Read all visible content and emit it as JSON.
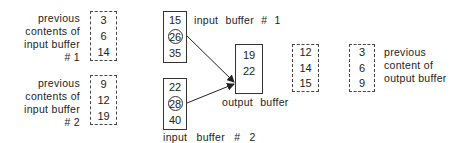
{
  "prev_input_1": {
    "label_lines": [
      "previous",
      "contents of",
      "input buffer",
      "# 1"
    ],
    "values": [
      "3",
      "6",
      "14"
    ]
  },
  "prev_input_2": {
    "label_lines": [
      "previous",
      "contents of",
      "input buffer",
      "# 2"
    ],
    "values": [
      "9",
      "12",
      "19"
    ]
  },
  "input_buffer_1": {
    "label": "input buffer # 1",
    "values": [
      "15",
      "26",
      "35"
    ],
    "highlighted_index": 1
  },
  "input_buffer_2": {
    "label": "input buffer # 2",
    "values": [
      "22",
      "28",
      "40"
    ],
    "highlighted_index": 1
  },
  "output_buffer": {
    "label": "output buffer",
    "values": [
      "19",
      "22"
    ]
  },
  "prev_output_a": {
    "values": [
      "12",
      "14",
      "15"
    ]
  },
  "prev_output_b": {
    "label_lines": [
      "previous",
      "content of",
      "output buffer"
    ],
    "values": [
      "3",
      "6",
      "9"
    ]
  }
}
